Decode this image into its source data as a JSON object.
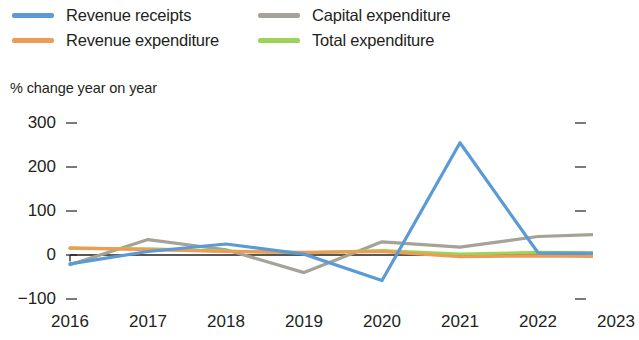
{
  "legend": {
    "items": [
      {
        "label": "Revenue receipts",
        "color": "#5b9bd5",
        "key": "revenue_receipts"
      },
      {
        "label": "Revenue expenditure",
        "color": "#ed9b55",
        "key": "revenue_expenditure"
      },
      {
        "label": "Capital expenditure",
        "color": "#a6a297",
        "key": "capital_expenditure"
      },
      {
        "label": "Total expenditure",
        "color": "#9dd356",
        "key": "total_expenditure"
      }
    ]
  },
  "axis_title": "% change year on year",
  "y_ticks": [
    "300",
    "200",
    "100",
    "0",
    "−100"
  ],
  "x_ticks": [
    "2016",
    "2017",
    "2018",
    "2019",
    "2020",
    "2021",
    "2022",
    "2023"
  ],
  "chart_data": {
    "type": "line",
    "title": "",
    "subtitle": "",
    "xlabel": "",
    "ylabel": "% change year on year",
    "ylim": [
      -100,
      300
    ],
    "y_tick_values": [
      300,
      200,
      100,
      0,
      -100
    ],
    "grid": false,
    "legend_position": "top",
    "categories": [
      "2016",
      "2017",
      "2018",
      "2019",
      "2020",
      "2021",
      "2022",
      "2023"
    ],
    "series": [
      {
        "name": "Revenue receipts",
        "color": "#5b9bd5",
        "values": [
          -20,
          8,
          25,
          2,
          -58,
          255,
          5,
          3
        ]
      },
      {
        "name": "Revenue expenditure",
        "color": "#ed9b55",
        "values": [
          16,
          12,
          8,
          6,
          8,
          -4,
          -2,
          -4
        ]
      },
      {
        "name": "Capital expenditure",
        "color": "#a6a297",
        "values": [
          -22,
          35,
          12,
          -40,
          30,
          18,
          42,
          48
        ]
      },
      {
        "name": "Total expenditure",
        "color": "#9dd356",
        "values": [
          15,
          14,
          9,
          5,
          10,
          2,
          6,
          5
        ]
      }
    ]
  }
}
